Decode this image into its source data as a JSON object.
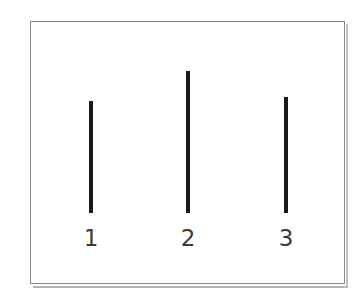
{
  "figure": {
    "background_color": "#ffffff",
    "frame_color": "#8a8a8a",
    "bar_color": "#1a1a1a",
    "label_color": "#3b3b3b"
  },
  "chart_data": {
    "type": "bar",
    "title": "",
    "subtitle": "",
    "xlabel": "",
    "ylabel": "",
    "categories": [
      "1",
      "2",
      "3"
    ],
    "values": [
      112,
      142,
      116
    ],
    "value_units": "px",
    "baseline": 0,
    "ylim": [
      0,
      180
    ],
    "grid": false,
    "legend": null,
    "annotations": [],
    "bars": [
      {
        "category": "1",
        "value": 112,
        "center_x_px": 90,
        "top_y_px": 100,
        "bottom_y_px": 212
      },
      {
        "category": "2",
        "value": 142,
        "center_x_px": 187,
        "top_y_px": 70,
        "bottom_y_px": 212
      },
      {
        "category": "3",
        "value": 116,
        "center_x_px": 285,
        "top_y_px": 96,
        "bottom_y_px": 212
      }
    ]
  }
}
